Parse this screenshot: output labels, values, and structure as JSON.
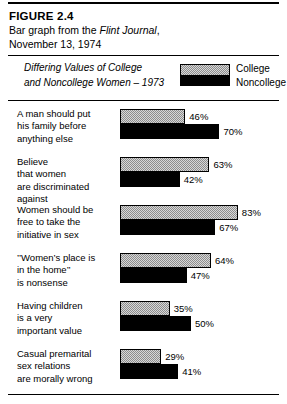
{
  "figure": {
    "number_label": "FIGURE 2.4",
    "caption_prefix": "Bar graph from the ",
    "caption_source": "Flint Journal",
    "caption_suffix": ",",
    "caption_line2": "November 13, 1974"
  },
  "legend": {
    "title_line1": "Differing Values of College",
    "title_line2": "and Noncollege Women – 1973",
    "keys": [
      {
        "label": "College",
        "swatch": "stippled-gray"
      },
      {
        "label": "Noncollege",
        "swatch": "solid-black"
      }
    ]
  },
  "chart_data": {
    "type": "bar",
    "orientation": "horizontal",
    "title": "Differing Values of College and Noncollege Women – 1973",
    "xlabel": "",
    "ylabel": "",
    "xlim": [
      0,
      100
    ],
    "grid": false,
    "legend_position": "top-right",
    "value_suffix": "%",
    "categories": [
      "A man should put his family before anything else",
      "Believe that women are discriminated against",
      "Women should be free to take the initiative in sex",
      "“Women’s place is in the home” is nonsense",
      "Having children is a very important value",
      "Casual premarital sex relations are morally wrong"
    ],
    "category_lines": [
      [
        "A man should put",
        "his family before",
        "anything else"
      ],
      [
        "Believe",
        "that women",
        "are discriminated",
        "against"
      ],
      [
        "Women should be",
        "free to take the",
        "initiative in sex"
      ],
      [
        "’’Women’s place is",
        "in the home’’",
        "is nonsense"
      ],
      [
        "Having children",
        "is a very",
        "important value"
      ],
      [
        "Casual premarital",
        "sex relations",
        "are morally wrong"
      ]
    ],
    "series": [
      {
        "name": "College",
        "values": [
          46,
          63,
          83,
          64,
          35,
          29
        ]
      },
      {
        "name": "Noncollege",
        "values": [
          70,
          42,
          67,
          47,
          50,
          41
        ]
      }
    ],
    "value_labels": {
      "College": [
        "46%",
        "63%",
        "83%",
        "64%",
        "35%",
        "29%"
      ],
      "Noncollege": [
        "70%",
        "42%",
        "67%",
        "47%",
        "50%",
        "41%"
      ]
    }
  },
  "colors": {
    "college_fill": "#d8d8d8",
    "noncollege_fill": "#000000",
    "outline": "#000000",
    "background": "#ffffff"
  }
}
